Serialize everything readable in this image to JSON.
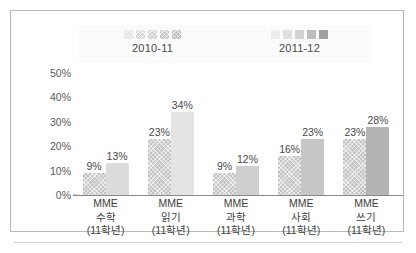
{
  "chart_data": {
    "type": "bar",
    "title": "",
    "subtitle": "",
    "xlabel": "",
    "ylabel": "",
    "ylim": [
      0,
      50
    ],
    "grid": false,
    "legend_position": "top",
    "categories": [
      "MME\n수학\n(11학년)",
      "MME\n읽기\n(11학년)",
      "MME\n과학\n(11학년)",
      "MME\n사회\n(11학년)",
      "MME\n쓰기\n(11학년)"
    ],
    "category_lines": [
      [
        "MME",
        "수학",
        "(11학년)"
      ],
      [
        "MME",
        "읽기",
        "(11학년)"
      ],
      [
        "MME",
        "과학",
        "(11학년)"
      ],
      [
        "MME",
        "사회",
        "(11학년)"
      ],
      [
        "MME",
        "쓰기",
        "(11학년)"
      ]
    ],
    "series": [
      {
        "name": "2010-11",
        "values": [
          9,
          23,
          9,
          16,
          23
        ],
        "value_labels": [
          "9%",
          "23%",
          "9%",
          "16%",
          "23%"
        ],
        "fill": "hatched",
        "color": "#c2c2c2"
      },
      {
        "name": "2011-12",
        "values": [
          13,
          34,
          12,
          23,
          28
        ],
        "value_labels": [
          "13%",
          "34%",
          "12%",
          "23%",
          "28%"
        ],
        "fill": "solid",
        "colors": [
          "#dcdcdc",
          "#e4e4e4",
          "#cfcfcf",
          "#c6c6c6",
          "#b4b4b4"
        ]
      }
    ],
    "yticks": [
      50,
      40,
      30,
      20,
      10,
      0
    ],
    "ytick_labels": [
      "50%",
      "40%",
      "30%",
      "20%",
      "10%",
      "0%"
    ]
  },
  "legend": {
    "groups": [
      {
        "label": "2010-11",
        "swatch_colors": [
          "#e3e3e3",
          "#dadada",
          "#d0d0d0",
          "#c6c6c6",
          "#bdbdbd"
        ],
        "swatch_style": "hatched"
      },
      {
        "label": "2011-12",
        "swatch_colors": [
          "#ededed",
          "#e0e0e0",
          "#d2d2d2",
          "#bdbdbd",
          "#a0a0a0"
        ],
        "swatch_style": "solid"
      }
    ]
  },
  "colors": {
    "frame_border": "#b9b9b9",
    "axis_line": "#8a8a8a",
    "tick_text": "#5a5a5a",
    "label_text": "#3d3d3d",
    "legend_bg": "#fbfbfb"
  }
}
